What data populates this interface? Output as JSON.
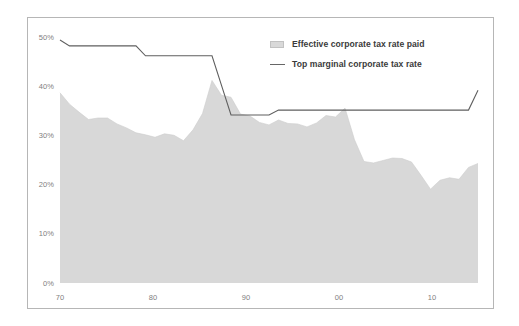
{
  "chart_data": {
    "type": "area",
    "title": "",
    "subtitle": "",
    "xlabel": "",
    "ylabel": "",
    "xlim": [
      1970,
      2014
    ],
    "ylim": [
      0,
      50
    ],
    "grid": false,
    "legend_position": "top-right",
    "y_tick_labels": [
      "50%",
      "40%",
      "30%",
      "20%",
      "10%",
      "0%"
    ],
    "y_tick_values": [
      50,
      40,
      30,
      20,
      10,
      0
    ],
    "x_tick_labels": [
      "70",
      "80",
      "90",
      "00",
      "10"
    ],
    "x_tick_values": [
      1970,
      1980,
      1990,
      2000,
      2010
    ],
    "x": [
      1970,
      1971,
      1972,
      1973,
      1974,
      1975,
      1976,
      1977,
      1978,
      1979,
      1980,
      1981,
      1982,
      1983,
      1984,
      1985,
      1986,
      1987,
      1988,
      1989,
      1990,
      1991,
      1992,
      1993,
      1994,
      1995,
      1996,
      1997,
      1998,
      1999,
      2000,
      2001,
      2002,
      2003,
      2004,
      2005,
      2006,
      2007,
      2008,
      2009,
      2010,
      2011,
      2012,
      2013,
      2014
    ],
    "series": [
      {
        "name": "Effective corporate tax rate paid",
        "kind": "area",
        "color": "#d8d8d8",
        "values": [
          38.5,
          36.2,
          34.6,
          33.1,
          33.4,
          33.4,
          32.2,
          31.4,
          30.4,
          30.0,
          29.5,
          30.2,
          29.9,
          28.8,
          31.0,
          34.3,
          41.0,
          38.0,
          37.6,
          34.2,
          33.8,
          32.5,
          32.0,
          33.0,
          32.3,
          32.2,
          31.6,
          32.4,
          33.9,
          33.6,
          35.4,
          29.0,
          24.6,
          24.3,
          24.8,
          25.3,
          25.2,
          24.5,
          21.8,
          19.0,
          20.8,
          21.3,
          21.0,
          23.4,
          24.2
        ]
      },
      {
        "name": "Top marginal corporate tax rate",
        "kind": "line",
        "color": "#5f5f5f",
        "values": [
          49.2,
          48.0,
          48.0,
          48.0,
          48.0,
          48.0,
          48.0,
          48.0,
          48.0,
          46.0,
          46.0,
          46.0,
          46.0,
          46.0,
          46.0,
          46.0,
          46.0,
          40.0,
          34.0,
          34.0,
          34.0,
          34.0,
          34.0,
          35.0,
          35.0,
          35.0,
          35.0,
          35.0,
          35.0,
          35.0,
          35.0,
          35.0,
          35.0,
          35.0,
          35.0,
          35.0,
          35.0,
          35.0,
          35.0,
          35.0,
          35.0,
          35.0,
          35.0,
          35.0,
          39.0
        ]
      }
    ],
    "legend": [
      {
        "label": "Effective corporate tax rate paid",
        "marker": "swatch"
      },
      {
        "label": "Top marginal corporate tax rate",
        "marker": "line"
      }
    ],
    "colors": {
      "area_fill": "#d8d8d8",
      "line": "#5f5f5f",
      "axis_text": "#808080",
      "frame": "#b6b6b6",
      "legend_text": "#3b3b3b",
      "background": "#ffffff"
    }
  }
}
